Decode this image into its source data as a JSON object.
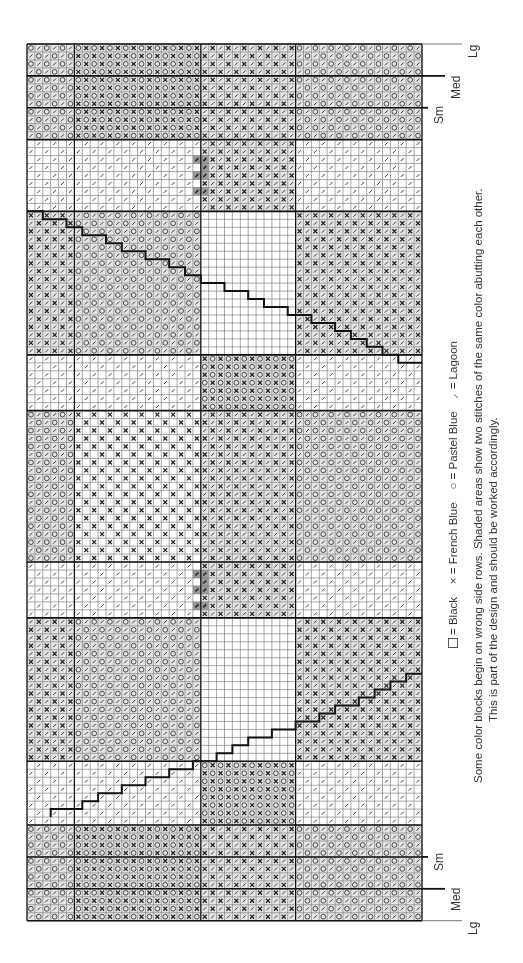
{
  "chart_data": {
    "type": "table",
    "grid": {
      "cols": 50,
      "rows": 110,
      "origin_x": 27,
      "origin_y": 44,
      "cell_w": 7.9,
      "cell_h": 7.97
    },
    "symbols": {
      "B": "Black (blank square)",
      "X": "French Blue (×)",
      "O": "Pastel Blue (○)",
      "L": "Lagoon (/)"
    },
    "col_bands": [
      {
        "name": "A",
        "from": 0,
        "to": 5
      },
      {
        "name": "B",
        "from": 6,
        "to": 16
      },
      {
        "name": "C",
        "from": 17,
        "to": 21
      },
      {
        "name": "D",
        "from": 22,
        "to": 33
      },
      {
        "name": "E",
        "from": 34,
        "to": 49
      }
    ],
    "row_blocks": [
      {
        "from": 0,
        "to": 11,
        "fills": {
          "A": "LO",
          "B": "OX",
          "C": "OX",
          "D": "LX",
          "E": "LO"
        }
      },
      {
        "from": 12,
        "to": 18,
        "fills": {
          "A": "Ls",
          "B": "Ls",
          "C": "Ls",
          "D": "LX",
          "E": "Ls"
        },
        "shade": [
          {
            "col": 21,
            "rows": [
              14,
              16,
              18
            ]
          },
          {
            "col": 22,
            "rows": [
              14,
              15,
              16,
              18
            ]
          }
        ]
      },
      {
        "from": 19,
        "to": 20,
        "fills": {
          "A": "Ls",
          "B": "Ls",
          "C": "Ls",
          "D": "LX",
          "E": "Ls"
        }
      },
      {
        "from": 21,
        "to": 38,
        "fills": {
          "A": "LX",
          "B": "LO",
          "C": "LO",
          "D": "B",
          "E": "LX"
        }
      },
      {
        "from": 39,
        "to": 45,
        "fills": {
          "A": "Ls",
          "B": "Ls",
          "C": "Ls",
          "D": "OX",
          "E": "Ls"
        }
      },
      {
        "from": 46,
        "to": 64,
        "fills": {
          "A": "LO",
          "B": "Xs",
          "C": "Xs",
          "D": "LX",
          "E": "LO"
        }
      },
      {
        "from": 65,
        "to": 71,
        "fills": {
          "A": "Ls",
          "B": "Ls",
          "C": "Ls",
          "D": "LX",
          "E": "Ls"
        },
        "shade": [
          {
            "col": 21,
            "rows": [
              66,
              68,
              70
            ]
          },
          {
            "col": 22,
            "rows": [
              66,
              67,
              68,
              70
            ]
          }
        ]
      },
      {
        "from": 72,
        "to": 89,
        "fills": {
          "A": "LX",
          "B": "LO",
          "C": "LO",
          "D": "B",
          "E": "LX"
        }
      },
      {
        "from": 90,
        "to": 97,
        "fills": {
          "A": "Ls",
          "B": "Ls",
          "C": "Ls",
          "D": "OX",
          "E": "Ls"
        }
      },
      {
        "from": 98,
        "to": 109,
        "fills": {
          "A": "LO",
          "B": "OX",
          "C": "OX",
          "D": "LX",
          "E": "LO"
        }
      }
    ],
    "stair_lines": [
      {
        "points": [
          [
            0,
            21
          ],
          [
            2,
            21
          ],
          [
            2,
            22
          ],
          [
            5,
            22
          ],
          [
            5,
            23
          ],
          [
            7,
            23
          ],
          [
            7,
            24
          ],
          [
            10,
            24
          ],
          [
            10,
            25
          ],
          [
            12,
            25
          ],
          [
            12,
            26
          ],
          [
            15,
            26
          ],
          [
            15,
            27
          ],
          [
            18,
            27
          ],
          [
            18,
            28
          ],
          [
            20,
            28
          ],
          [
            20,
            29
          ],
          [
            22,
            29
          ],
          [
            22,
            30
          ],
          [
            25,
            30
          ],
          [
            25,
            31
          ],
          [
            28,
            31
          ],
          [
            28,
            32
          ],
          [
            30,
            32
          ],
          [
            30,
            33
          ],
          [
            33,
            33
          ],
          [
            33,
            34
          ],
          [
            36,
            34
          ],
          [
            36,
            35
          ],
          [
            39,
            35
          ],
          [
            39,
            36
          ],
          [
            41,
            36
          ],
          [
            41,
            37
          ],
          [
            43,
            37
          ],
          [
            43,
            38
          ],
          [
            45,
            38
          ],
          [
            45,
            39
          ],
          [
            47,
            39
          ],
          [
            47,
            40
          ],
          [
            50,
            40
          ]
        ]
      },
      {
        "points": [
          [
            3,
            97
          ],
          [
            3,
            96
          ],
          [
            7,
            96
          ],
          [
            7,
            95
          ],
          [
            9,
            95
          ],
          [
            9,
            94
          ],
          [
            12,
            94
          ],
          [
            12,
            93
          ],
          [
            15,
            93
          ],
          [
            15,
            92
          ],
          [
            18,
            92
          ],
          [
            18,
            91
          ],
          [
            21,
            91
          ],
          [
            21,
            90
          ],
          [
            24,
            90
          ],
          [
            24,
            89
          ],
          [
            26,
            89
          ],
          [
            26,
            88
          ],
          [
            28,
            88
          ],
          [
            28,
            87
          ],
          [
            31,
            87
          ],
          [
            31,
            86
          ],
          [
            34,
            86
          ],
          [
            34,
            85
          ],
          [
            37,
            85
          ],
          [
            37,
            84
          ],
          [
            39,
            84
          ],
          [
            39,
            83
          ],
          [
            42,
            83
          ],
          [
            42,
            82
          ],
          [
            44,
            82
          ],
          [
            44,
            81
          ],
          [
            46,
            81
          ],
          [
            46,
            80
          ],
          [
            48,
            80
          ],
          [
            48,
            79
          ],
          [
            50,
            79
          ]
        ]
      }
    ],
    "thick_row_lines": [
      0,
      4,
      8,
      12,
      21,
      39,
      46,
      65,
      72,
      90,
      98,
      102,
      106,
      110
    ],
    "thick_col_lines": [
      0,
      6,
      22,
      34,
      50
    ],
    "size_markers": [
      {
        "label": "Lg",
        "row": 0,
        "ext": 40
      },
      {
        "label": "Med",
        "row": 4,
        "ext": 23
      },
      {
        "label": "Sm",
        "row": 8,
        "ext": 6
      },
      {
        "label": "Sm",
        "row": 102,
        "ext": 6
      },
      {
        "label": "Med",
        "row": 106,
        "ext": 23
      },
      {
        "label": "Lg",
        "row": 110,
        "ext": 40
      }
    ]
  },
  "legend": {
    "black": "= Black",
    "french_blue_symbol": "×",
    "french_blue": "= French Blue",
    "pastel_blue_symbol": "○",
    "pastel_blue": "= Pastel Blue",
    "lagoon_symbol": "⸝",
    "lagoon": "= Lagoon"
  },
  "caption": {
    "line1": "Some color blocks begin on wrong side rows. Shaded areas show two stitches of the same color abutting each other.",
    "line2": "This is part of the design and should be worked accordingly."
  },
  "size_labels": {
    "lg": "Lg",
    "med": "Med",
    "sm": "Sm"
  }
}
